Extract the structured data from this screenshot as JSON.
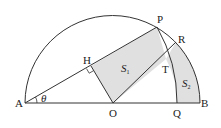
{
  "diagram": {
    "type": "geometry",
    "points": {
      "A": {
        "label": "A",
        "x": 25,
        "y": 103
      },
      "O": {
        "label": "O",
        "x": 113,
        "y": 103
      },
      "B": {
        "label": "B",
        "x": 200,
        "y": 103
      },
      "P": {
        "label": "P",
        "x": 157,
        "y": 27
      },
      "R": {
        "label": "R",
        "x": 176,
        "y": 42
      },
      "H": {
        "label": "H",
        "x": 91,
        "y": 66
      },
      "T": {
        "label": "T",
        "x": 166,
        "y": 59
      },
      "Q": {
        "label": "Q",
        "x": 177,
        "y": 103
      }
    },
    "angle_label": "θ",
    "regions": [
      {
        "name": "S",
        "subscript": "1"
      },
      {
        "name": "S",
        "subscript": "2"
      }
    ],
    "colors": {
      "stroke": "#333333",
      "fill": "#e0e0e0"
    }
  }
}
